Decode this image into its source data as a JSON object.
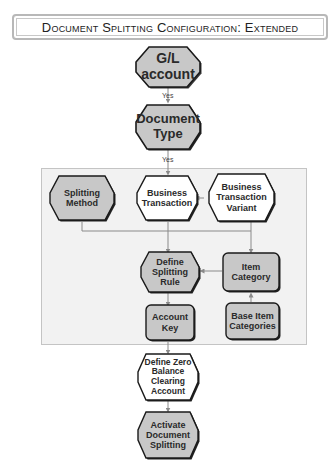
{
  "title": "Document Splitting Configuration: Extended",
  "colors": {
    "gray_fill": "#c8c8c8",
    "white_fill": "#ffffff",
    "stroke": "#1a1a1a",
    "connector": "#8a8a8a",
    "group_bg": "#f2f2f2"
  },
  "nodes": {
    "gl_account": "G/L account",
    "document_type": "Document Type",
    "splitting_method": "Splitting Method",
    "business_transaction": "Business Transaction",
    "business_transaction_variant": "Business Transaction Variant",
    "define_splitting_rule": "Define Splitting Rule",
    "item_category": "Item Category",
    "account_key": "Account Key",
    "base_item_categories": "Base Item Categories",
    "define_zero_balance": "Define Zero Balance Clearing Account",
    "activate_document_splitting": "Activate Document Splitting"
  },
  "edge_labels": {
    "yes1": "Yes",
    "yes2": "Yes"
  }
}
